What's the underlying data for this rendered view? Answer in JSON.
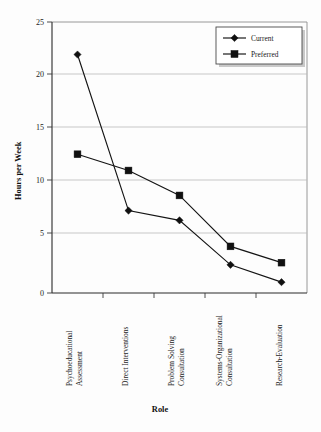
{
  "chart_data": {
    "type": "line",
    "title": "",
    "xlabel": "Role",
    "ylabel": "Hours per Week",
    "ylim": [
      0,
      25
    ],
    "yticks": [
      0,
      5,
      10,
      15,
      20,
      25
    ],
    "grid": true,
    "legend_position": "top-right",
    "categories": [
      "Psychoeducational Assessment",
      "Direct Interventions",
      "Problem Solving Consultation",
      "Systems-Organizational Consultation",
      "Research-Evaluation"
    ],
    "series": [
      {
        "name": "Current",
        "marker": "diamond",
        "values": [
          22.0,
          7.6,
          6.7,
          2.6,
          1.0
        ]
      },
      {
        "name": "Preferred",
        "marker": "square",
        "values": [
          12.8,
          11.3,
          9.0,
          4.3,
          2.8
        ]
      }
    ]
  },
  "axes": {
    "y_title": "Hours per Week",
    "x_title": "Role",
    "ytick_labels": [
      "0",
      "5",
      "10",
      "15",
      "20",
      "25"
    ]
  },
  "legend": {
    "entries": [
      {
        "label": "Current"
      },
      {
        "label": "Preferred"
      }
    ]
  },
  "categories_text": {
    "c0_line1": "Psychoeducational",
    "c0_line2": "Assessment",
    "c1_line1": "Direct Interventions",
    "c1_line2": "",
    "c2_line1": "Problem Solving",
    "c2_line2": "Consultation",
    "c3_line1": "Systems-Organizational",
    "c3_line2": "Consultation",
    "c4_line1": "Research-Evaluation",
    "c4_line2": ""
  },
  "colors": {
    "ink": "#101010",
    "grid": "#b9b9b9",
    "axis": "#2a2a2a",
    "background": "#fdfdfd"
  }
}
